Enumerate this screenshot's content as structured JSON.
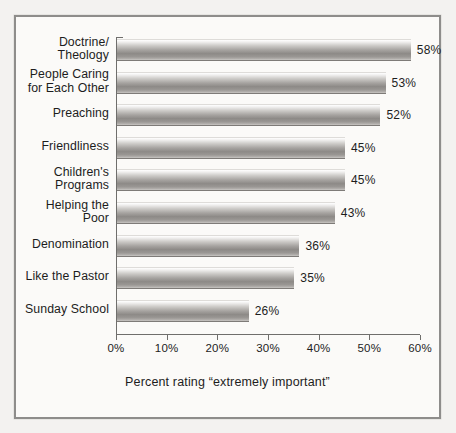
{
  "chart_data": {
    "type": "bar",
    "orientation": "horizontal",
    "title": "",
    "xlabel": "Percent rating “extremely important”",
    "ylabel": "",
    "xlim": [
      0,
      60
    ],
    "xticks": [
      0,
      10,
      20,
      30,
      40,
      50,
      60
    ],
    "xtick_labels": [
      "0%",
      "10%",
      "20%",
      "30%",
      "40%",
      "50%",
      "60%"
    ],
    "grid": false,
    "legend": null,
    "categories": [
      "Doctrine/\nTheology",
      "People Caring\nfor Each Other",
      "Preaching",
      "Friendliness",
      "Children's\nPrograms",
      "Helping the\nPoor",
      "Denomination",
      "Like the Pastor",
      "Sunday School"
    ],
    "values": [
      58,
      53,
      52,
      45,
      45,
      43,
      36,
      35,
      26
    ],
    "value_labels": [
      "58%",
      "53%",
      "52%",
      "45%",
      "45%",
      "43%",
      "36%",
      "35%",
      "26%"
    ],
    "bar_fill": "#a6a3a0",
    "axis_color": "#6f6e6c",
    "frame_color": "#8e8d8b",
    "background": "#fbfaf8"
  }
}
